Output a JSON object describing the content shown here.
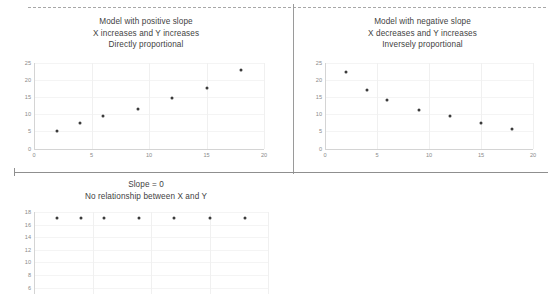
{
  "figure": {
    "panels": [
      {
        "id": "positive",
        "title_lines": [
          "Model with positive slope",
          "X increases and Y increases",
          "Directly proportional"
        ]
      },
      {
        "id": "negative",
        "title_lines": [
          "Model with negative slope",
          "X decreases and Y increases",
          "Inversely proportional"
        ]
      },
      {
        "id": "zero",
        "title_lines": [
          "Slope = 0",
          "No relationship between X and Y"
        ]
      }
    ]
  },
  "chart_data": [
    {
      "type": "scatter",
      "title": "Model with positive slope / X increases and Y increases / Directly proportional",
      "xlabel": "",
      "ylabel": "",
      "xlim": [
        0,
        20
      ],
      "ylim": [
        0,
        25
      ],
      "xticks": [
        0,
        5,
        10,
        15,
        20
      ],
      "yticks": [
        0,
        5,
        10,
        15,
        20,
        25
      ],
      "grid": true,
      "legend": "none",
      "x": [
        2,
        4,
        6,
        9,
        12,
        15,
        18
      ],
      "y": [
        5.2,
        7.3,
        9.5,
        11.5,
        14.7,
        17.7,
        22.8
      ]
    },
    {
      "type": "scatter",
      "title": "Model with negative slope / X decreases and Y increases / Inversely proportional",
      "xlabel": "",
      "ylabel": "",
      "xlim": [
        0,
        20
      ],
      "ylim": [
        0,
        25
      ],
      "xticks": [
        0,
        5,
        10,
        15,
        20
      ],
      "yticks": [
        0,
        5,
        10,
        15,
        20,
        25
      ],
      "grid": true,
      "legend": "none",
      "x": [
        2,
        4,
        6,
        9,
        12,
        15,
        18
      ],
      "y": [
        22.1,
        17.0,
        14.2,
        11.3,
        9.4,
        7.5,
        5.7
      ]
    },
    {
      "type": "scatter",
      "title": "Slope = 0 / No relationship between X and Y",
      "xlabel": "",
      "ylabel": "",
      "xlim": [
        0,
        20
      ],
      "ylim": [
        5,
        18
      ],
      "xticks": [],
      "yticks": [
        6,
        8,
        10,
        12,
        14,
        16,
        18
      ],
      "grid": true,
      "legend": "none",
      "x": [
        2,
        4,
        6,
        9,
        12,
        15,
        18
      ],
      "y": [
        17,
        17,
        17,
        17,
        17,
        17,
        17
      ]
    }
  ],
  "axes": {
    "positive": {
      "y_tick_labels": [
        "25",
        "20",
        "15",
        "10",
        "5",
        "0"
      ],
      "x_tick_labels": [
        "0",
        "5",
        "10",
        "15",
        "20"
      ]
    },
    "negative": {
      "y_tick_labels": [
        "25",
        "20",
        "15",
        "10",
        "5",
        "0"
      ],
      "x_tick_labels": [
        "0",
        "5",
        "10",
        "15",
        "20"
      ]
    },
    "zero": {
      "y_tick_labels": [
        "18",
        "16",
        "14",
        "12",
        "10",
        "8",
        "6"
      ],
      "x_tick_labels": []
    }
  },
  "colors": {
    "point": "#3b3b3b",
    "axis": "#d4d4d4",
    "grid": "#f0f0f0",
    "divider": "#8f8f8f",
    "text": "#3f3f3f",
    "tick_text": "#8a8a8a",
    "background": "#ffffff"
  }
}
